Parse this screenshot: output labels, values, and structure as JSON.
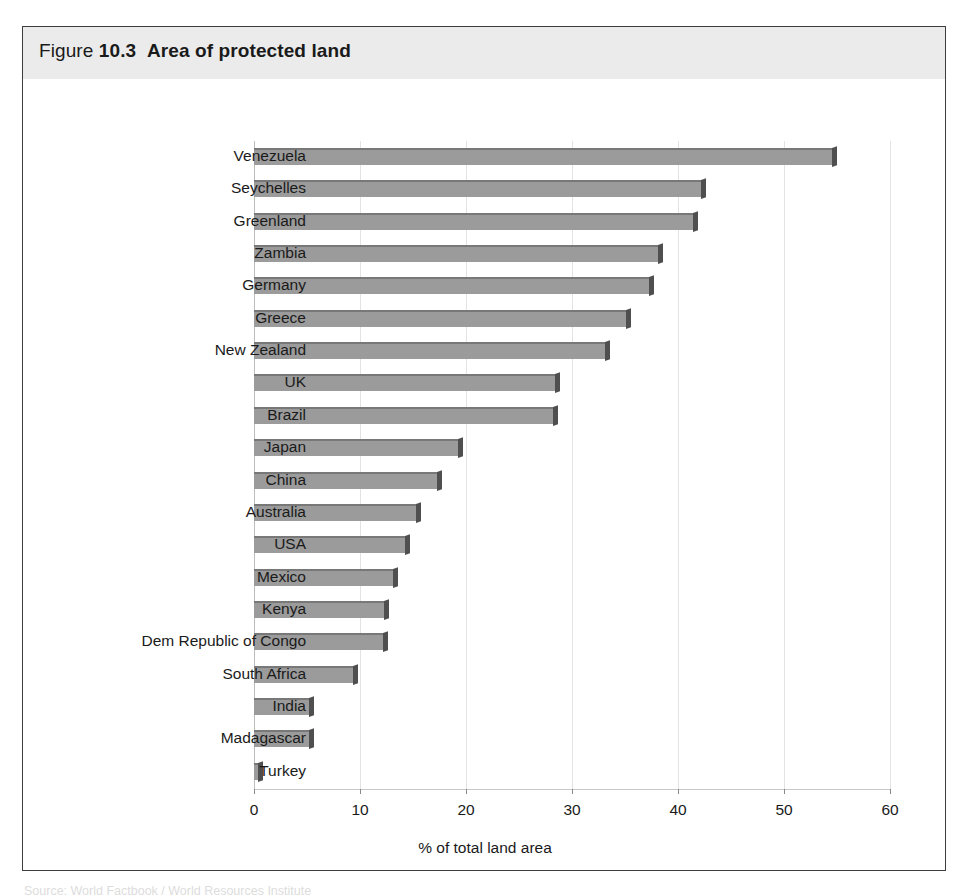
{
  "figure": {
    "label_lead": "Figure",
    "number": "10.3",
    "caption": "Area of protected land"
  },
  "colors": {
    "bar_face": "#9b9b9b",
    "bar_top_edge": "#787878",
    "bar_end_cap": "#4f4f4f",
    "title_band": "#ebebeb",
    "panel_border": "#3d3d3d",
    "gridline": "#e3e3e3",
    "text": "#1a1a1a"
  },
  "source_note": "Source: World Factbook / World Resources Institute",
  "chart_data": {
    "type": "bar",
    "orientation": "horizontal",
    "title": "Area of protected land",
    "xlabel": "% of total land area",
    "ylabel": "",
    "xlim": [
      0,
      60
    ],
    "xticks": [
      0,
      10,
      20,
      30,
      40,
      50,
      60
    ],
    "xticklabels": [
      "0",
      "10",
      "20",
      "30",
      "40",
      "50",
      "60"
    ],
    "grid": true,
    "grid_axis": "x",
    "legend": false,
    "categories": [
      "Venezuela",
      "Seychelles",
      "Greenland",
      "Zambia",
      "Germany",
      "Greece",
      "New Zealand",
      "UK",
      "Brazil",
      "Japan",
      "China",
      "Australia",
      "USA",
      "Mexico",
      "Kenya",
      "Dem Republic of Congo",
      "South Africa",
      "India",
      "Madagascar",
      "Turkey"
    ],
    "values": [
      54.5,
      42.2,
      41.4,
      38.1,
      37.3,
      35.1,
      33.1,
      28.4,
      28.2,
      19.2,
      17.3,
      15.3,
      14.2,
      13.1,
      12.3,
      12.2,
      9.3,
      5.2,
      5.2,
      0.4
    ]
  }
}
